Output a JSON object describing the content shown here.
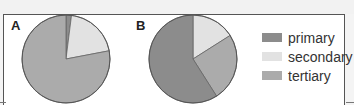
{
  "chart_data": [
    {
      "type": "pie",
      "title": "A",
      "categories": [
        "primary",
        "secondary",
        "tertiary"
      ],
      "values": [
        2,
        20,
        78
      ]
    },
    {
      "type": "pie",
      "title": "B",
      "categories": [
        "primary",
        "secondary",
        "tertiary"
      ],
      "values": [
        59,
        16,
        25
      ]
    }
  ],
  "panels": {
    "a_label": "A",
    "b_label": "B"
  },
  "legend": {
    "position": "right",
    "items": [
      {
        "label": "primary",
        "color": "#8c8c8c"
      },
      {
        "label": "secondary",
        "color": "#e2e2e2"
      },
      {
        "label": "tertiary",
        "color": "#ababab"
      }
    ]
  },
  "colors": {
    "primary": "#8c8c8c",
    "secondary": "#e2e2e2",
    "tertiary": "#ababab",
    "outline": "#555555"
  }
}
